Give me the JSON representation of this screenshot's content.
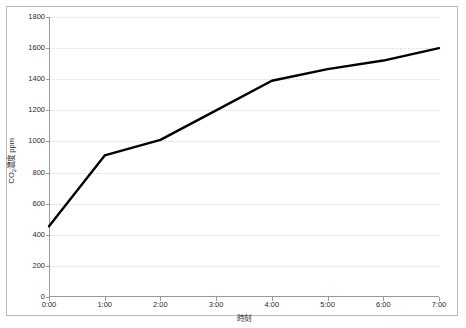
{
  "figure": {
    "frame_border_color": "#b8b8b8",
    "background": "#ffffff"
  },
  "axes": {
    "y_title_prefix": "CO",
    "y_title_sub": "2",
    "y_title_suffix": "濃度 ppm",
    "x_title": "時刻"
  },
  "chart_data": {
    "type": "line",
    "title": "",
    "subtitle": "",
    "xlabel": "時刻",
    "ylabel": "CO2濃度 ppm",
    "categories": [
      "0:00",
      "1:00",
      "2:00",
      "3:00",
      "4:00",
      "5:00",
      "6:00",
      "7:00"
    ],
    "x": [
      0,
      1,
      2,
      3,
      4,
      5,
      6,
      7
    ],
    "values": [
      455,
      910,
      1010,
      1200,
      1390,
      1465,
      1520,
      1600
    ],
    "series": [
      {
        "name": "CO2濃度",
        "values": [
          455,
          910,
          1010,
          1200,
          1390,
          1465,
          1520,
          1600
        ],
        "color": "#000000",
        "line_width": 2.4,
        "markers": false
      }
    ],
    "ylim": [
      0,
      1800
    ],
    "xlim": [
      0,
      7
    ],
    "y_ticks": [
      0,
      200,
      400,
      600,
      800,
      1000,
      1200,
      1400,
      1600,
      1800
    ],
    "y_tick_labels": [
      "0",
      "200",
      "400",
      "600",
      "800",
      "1000",
      "1200",
      "1400",
      "1600",
      "1800"
    ],
    "x_ticks": [
      0,
      1,
      2,
      3,
      4,
      5,
      6,
      7
    ],
    "x_tick_labels": [
      "0:00",
      "1:00",
      "2:00",
      "3:00",
      "4:00",
      "5:00",
      "6:00",
      "7:00"
    ],
    "grid": {
      "horizontal": true,
      "vertical": false,
      "style": "dotted",
      "color": "#d9d9d9"
    },
    "legend": {
      "visible": false,
      "position": "none"
    },
    "axis_line_color": "#9a9a9a",
    "plot_background": "#ffffff"
  }
}
